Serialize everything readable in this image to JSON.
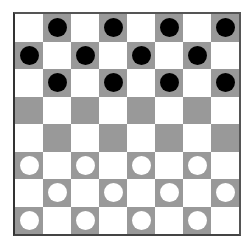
{
  "board": {
    "size": 8,
    "colors": {
      "light": "#ffffff",
      "dark": "#999999",
      "black_piece": "#000000",
      "white_piece": "#ffffff"
    },
    "rows": [
      [
        ".",
        "b",
        ".",
        "b",
        ".",
        "b",
        ".",
        "b"
      ],
      [
        "b",
        ".",
        "b",
        ".",
        "b",
        ".",
        "b",
        "."
      ],
      [
        ".",
        "b",
        ".",
        "b",
        ".",
        "b",
        ".",
        "b"
      ],
      [
        ".",
        ".",
        ".",
        ".",
        ".",
        ".",
        ".",
        "."
      ],
      [
        ".",
        ".",
        ".",
        ".",
        ".",
        ".",
        ".",
        "."
      ],
      [
        "w",
        ".",
        "w",
        ".",
        "w",
        ".",
        "w",
        "."
      ],
      [
        ".",
        "w",
        ".",
        "w",
        ".",
        "w",
        ".",
        "w"
      ],
      [
        "w",
        ".",
        "w",
        ".",
        "w",
        ".",
        "w",
        "."
      ]
    ]
  }
}
